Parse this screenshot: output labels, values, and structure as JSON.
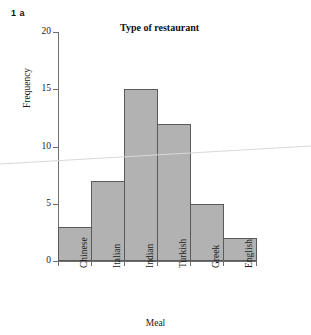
{
  "question_label": "1 a",
  "chart_data": {
    "type": "bar",
    "title": "Type of restaurant",
    "xlabel": "Meal",
    "ylabel": "Frequency",
    "categories": [
      "Chinese",
      "Italian",
      "Indian",
      "Turkish",
      "Greek",
      "English"
    ],
    "values": [
      3,
      7,
      15,
      12,
      5,
      2
    ],
    "ylim": [
      0,
      20
    ],
    "yticks": [
      0,
      5,
      10,
      15,
      20
    ],
    "ytick_labels": [
      "0",
      "5",
      "10",
      "15",
      "20"
    ],
    "grid": false,
    "legend": false,
    "bar_fill_color": "#b2b2b2",
    "bar_edge_color": "#5a5a5a",
    "axis_color": "#6e6e6e",
    "bars_adjacent": true
  }
}
